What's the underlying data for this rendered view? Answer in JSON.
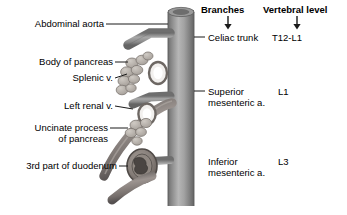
{
  "figure": {
    "background": "#ffffff",
    "vessel_color": "#8f8f8f",
    "vessel_light": "#c0c0c0",
    "vessel_dark": "#6b6b6b",
    "pancreas_color": "#b9b4ae",
    "duodenum_color": "#7a7470",
    "leader_color": "#1a1a1a"
  },
  "labels": {
    "abdominal_aorta": "Abdominal aorta",
    "body_of_pancreas": "Body of pancreas",
    "splenic_vein": "Splenic v.",
    "left_renal_vein": "Left renal v.",
    "uncinate_line1": "Uncinate process",
    "uncinate_line2": "of pancreas",
    "duodenum": "3rd part of duodenum"
  },
  "columns": {
    "branches_header": "Branches",
    "vertebral_header": "Vertebral level",
    "rows": [
      {
        "branch": "Celiac trunk",
        "branch_line2": "",
        "level": "T12-L1"
      },
      {
        "branch": "Superior",
        "branch_line2": "mesenteric a.",
        "level": "L1"
      },
      {
        "branch": "Inferior",
        "branch_line2": "mesenteric a.",
        "level": "L3"
      }
    ]
  }
}
